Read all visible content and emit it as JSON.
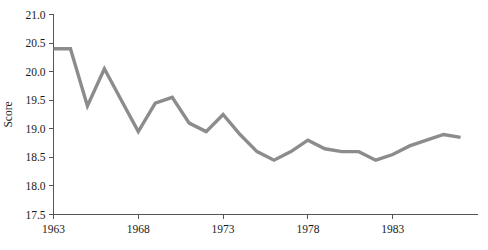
{
  "chart_data": {
    "type": "line",
    "title": "",
    "xlabel": "",
    "ylabel": "Score",
    "xlim": [
      1963,
      1988
    ],
    "ylim": [
      17.5,
      21.0
    ],
    "grid": false,
    "legend": false,
    "line_color": "#8c8c8c",
    "axis_color": "#555555",
    "ytick_labels": [
      "21.0",
      "20.5",
      "20.0",
      "19.5",
      "19.0",
      "18.5",
      "18.0",
      "17.5"
    ],
    "ytick_values": [
      21.0,
      20.5,
      20.0,
      19.5,
      19.0,
      18.5,
      18.0,
      17.5
    ],
    "xtick_labels": [
      "1963",
      "1968",
      "1973",
      "1978",
      "1983"
    ],
    "xtick_values": [
      1963,
      1968,
      1973,
      1978,
      1983
    ],
    "x": [
      1963,
      1964,
      1965,
      1966,
      1967,
      1968,
      1969,
      1970,
      1971,
      1972,
      1973,
      1974,
      1975,
      1976,
      1977,
      1978,
      1979,
      1980,
      1981,
      1982,
      1983,
      1984,
      1985,
      1986,
      1987
    ],
    "values": [
      20.4,
      20.4,
      19.4,
      20.05,
      19.5,
      18.95,
      19.45,
      19.55,
      19.1,
      18.95,
      19.25,
      18.9,
      18.6,
      18.45,
      18.6,
      18.8,
      18.65,
      18.6,
      18.6,
      18.45,
      18.55,
      18.7,
      18.8,
      18.9,
      18.85
    ],
    "series": [
      {
        "name": "Score",
        "values": [
          20.4,
          20.4,
          19.4,
          20.05,
          19.5,
          18.95,
          19.45,
          19.55,
          19.1,
          18.95,
          19.25,
          18.9,
          18.6,
          18.45,
          18.6,
          18.8,
          18.65,
          18.6,
          18.6,
          18.45,
          18.55,
          18.7,
          18.8,
          18.9,
          18.85
        ]
      }
    ]
  }
}
